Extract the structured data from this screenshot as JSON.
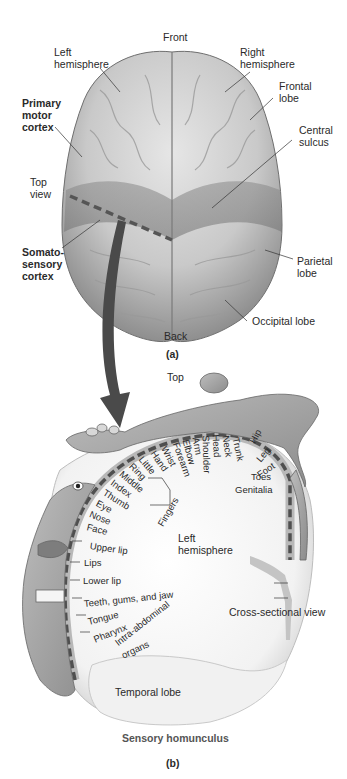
{
  "panel_a": {
    "caption": "(a)",
    "labels": {
      "front": "Front",
      "back": "Back",
      "left_hemisphere": [
        "Left",
        "hemisphere"
      ],
      "right_hemisphere": [
        "Right",
        "hemisphere"
      ],
      "frontal_lobe": [
        "Frontal",
        "lobe"
      ],
      "central_sulcus": [
        "Central",
        "sulcus"
      ],
      "primary_motor_cortex": [
        "Primary",
        "motor",
        "cortex"
      ],
      "top_view": [
        "Top",
        "view"
      ],
      "somatosensory_cortex": [
        "Somato-",
        "sensory",
        "cortex"
      ],
      "parietal_lobe": [
        "Parietal",
        "lobe"
      ],
      "occipital_lobe": "Occipital lobe"
    }
  },
  "panel_b": {
    "caption": "(b)",
    "title": "Sensory homunculus",
    "labels": {
      "top": "Top",
      "left_hemisphere": [
        "Left",
        "hemisphere"
      ],
      "cross_sectional_view": "Cross-sectional view",
      "temporal_lobe": "Temporal lobe",
      "fingers": "Fingers"
    },
    "body_parts_arc": [
      "Hip",
      "Trunk",
      "Neck",
      "Head",
      "Shoulder",
      "Arm",
      "Elbow",
      "Forearm",
      "Wrist",
      "Hand",
      "Little",
      "Ring",
      "Middle",
      "Index",
      "Thumb",
      "Eye",
      "Nose",
      "Face"
    ],
    "body_parts_right": [
      "Leg",
      "Foot",
      "Toes",
      "Genitalia"
    ],
    "body_parts_lower": [
      "Upper lip",
      "Lips",
      "Lower lip",
      "Teeth, gums, and jaw",
      "Tongue",
      "Pharynx",
      "Intra-abdominal",
      "organs"
    ]
  }
}
